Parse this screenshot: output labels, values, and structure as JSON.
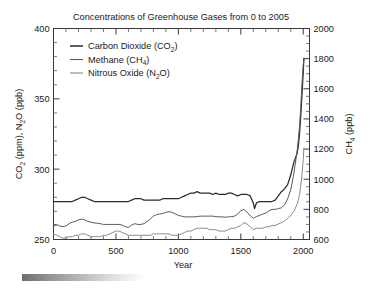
{
  "figure": {
    "title": "Concentrations of Greenhouse Gases from 0 to 2005",
    "background": "#ffffff"
  },
  "legend": {
    "position": "top-left-inside",
    "items": [
      {
        "label_main": "Carbon Dioxide (CO",
        "label_sub": "2",
        "label_end": ")",
        "color": "#2b2b2b",
        "key": "co2"
      },
      {
        "label_main": "Methane (CH",
        "label_sub": "4",
        "label_end": ")",
        "color": "#5a5a5a",
        "key": "ch4"
      },
      {
        "label_main": "Nitrous Oxide (N",
        "label_sub": "2",
        "label_end": "O)",
        "color": "#8a8a8a",
        "key": "n2o"
      }
    ]
  },
  "axes": {
    "x": {
      "label": "Year",
      "ticks": [
        "0",
        "500",
        "1000",
        "1500",
        "2000"
      ],
      "min": 0,
      "max": 2005,
      "minor_step": 100
    },
    "y_left": {
      "label_main": "CO",
      "label_sub1": "2",
      "label_mid": " (ppm), N",
      "label_sub2": "2",
      "label_end": "O (ppb)",
      "ticks": [
        "250",
        "300",
        "350",
        "400"
      ],
      "min": 250,
      "max": 400,
      "minor_step": 10
    },
    "y_right": {
      "label_main": "CH",
      "label_sub": "4",
      "label_end": " (ppb)",
      "ticks": [
        "600",
        "800",
        "1000",
        "1200",
        "1400",
        "1600",
        "1800",
        "2000"
      ],
      "min": 600,
      "max": 2000,
      "minor_step": 50
    }
  },
  "artifact": {
    "name": "gray-gradient-bar",
    "from": "#6e6e6e",
    "to": "#ffffff"
  },
  "chart_data": {
    "type": "line",
    "title": "Concentrations of Greenhouse Gases from 0 to 2005",
    "xlabel": "Year",
    "ylabel": "CO2 (ppm), N2O (ppb)",
    "ylabel_right": "CH4 (ppb)",
    "xlim": [
      0,
      2005
    ],
    "ylim_left": [
      250,
      400
    ],
    "ylim_right": [
      600,
      2000
    ],
    "grid": false,
    "legend_position": "upper left",
    "series": [
      {
        "name": "Carbon Dioxide (CO2)",
        "units": "ppm",
        "axis": "left",
        "color": "#2b2b2b",
        "x": [
          0,
          25,
          50,
          75,
          100,
          125,
          150,
          175,
          200,
          225,
          250,
          275,
          300,
          325,
          350,
          375,
          400,
          425,
          450,
          475,
          500,
          525,
          550,
          575,
          600,
          625,
          650,
          675,
          700,
          725,
          750,
          775,
          800,
          825,
          850,
          875,
          900,
          925,
          950,
          975,
          1000,
          1025,
          1050,
          1075,
          1100,
          1125,
          1150,
          1175,
          1200,
          1225,
          1250,
          1275,
          1300,
          1325,
          1350,
          1375,
          1400,
          1425,
          1450,
          1475,
          1500,
          1525,
          1550,
          1575,
          1600,
          1610,
          1625,
          1650,
          1675,
          1700,
          1725,
          1750,
          1775,
          1800,
          1825,
          1850,
          1875,
          1900,
          1925,
          1950,
          1960,
          1970,
          1980,
          1990,
          2000,
          2005
        ],
        "y": [
          277,
          277,
          277,
          277,
          277,
          277,
          277,
          278,
          279,
          280,
          280,
          279,
          278,
          277,
          277,
          277,
          277,
          277,
          277,
          277,
          277,
          277,
          277,
          277,
          277,
          278,
          279,
          279,
          279,
          278,
          278,
          278,
          278,
          278,
          278,
          279,
          279,
          279,
          279,
          279,
          279,
          280,
          281,
          282,
          283,
          283,
          284,
          283,
          283,
          283,
          283,
          282,
          283,
          282,
          282,
          282,
          283,
          283,
          282,
          281,
          282,
          282,
          282,
          281,
          276,
          272,
          276,
          277,
          277,
          277,
          277,
          277,
          278,
          281,
          284,
          286,
          289,
          296,
          305,
          311,
          316,
          325,
          338,
          353,
          369,
          379
        ]
      },
      {
        "name": "Methane (CH4)",
        "units": "ppb",
        "axis": "right",
        "color": "#5a5a5a",
        "x": [
          0,
          25,
          50,
          75,
          100,
          125,
          150,
          175,
          200,
          225,
          250,
          275,
          300,
          325,
          350,
          375,
          400,
          425,
          450,
          475,
          500,
          525,
          550,
          575,
          600,
          625,
          650,
          675,
          700,
          725,
          750,
          775,
          800,
          825,
          850,
          875,
          900,
          925,
          950,
          975,
          1000,
          1025,
          1050,
          1075,
          1100,
          1125,
          1150,
          1175,
          1200,
          1225,
          1250,
          1275,
          1300,
          1325,
          1350,
          1375,
          1400,
          1425,
          1450,
          1475,
          1500,
          1525,
          1550,
          1575,
          1600,
          1625,
          1650,
          1675,
          1700,
          1725,
          1750,
          1775,
          1800,
          1825,
          1850,
          1875,
          1900,
          1925,
          1950,
          1960,
          1970,
          1980,
          1990,
          2000,
          2005
        ],
        "y": [
          700,
          700,
          690,
          685,
          690,
          705,
          715,
          720,
          730,
          735,
          730,
          720,
          715,
          710,
          708,
          705,
          700,
          700,
          700,
          700,
          700,
          700,
          695,
          685,
          680,
          695,
          705,
          700,
          700,
          705,
          720,
          735,
          755,
          765,
          770,
          772,
          780,
          785,
          780,
          770,
          760,
          755,
          750,
          750,
          750,
          750,
          752,
          755,
          755,
          755,
          755,
          755,
          752,
          750,
          750,
          748,
          750,
          752,
          755,
          770,
          790,
          800,
          780,
          760,
          740,
          752,
          760,
          768,
          775,
          790,
          800,
          800,
          805,
          810,
          830,
          870,
          930,
          1040,
          1180,
          1260,
          1350,
          1480,
          1640,
          1760,
          1790
        ]
      },
      {
        "name": "Nitrous Oxide (N2O)",
        "units": "ppb",
        "axis": "left",
        "color": "#8a8a8a",
        "x": [
          0,
          25,
          50,
          75,
          100,
          125,
          150,
          175,
          200,
          225,
          250,
          275,
          300,
          325,
          350,
          375,
          400,
          425,
          450,
          475,
          500,
          525,
          550,
          575,
          600,
          625,
          650,
          675,
          700,
          725,
          750,
          775,
          800,
          825,
          850,
          875,
          900,
          925,
          950,
          975,
          1000,
          1025,
          1050,
          1075,
          1100,
          1125,
          1150,
          1175,
          1200,
          1225,
          1250,
          1275,
          1300,
          1325,
          1350,
          1375,
          1400,
          1425,
          1450,
          1475,
          1500,
          1525,
          1550,
          1575,
          1600,
          1625,
          1650,
          1675,
          1700,
          1725,
          1750,
          1775,
          1800,
          1825,
          1850,
          1875,
          1900,
          1925,
          1950,
          1960,
          1970,
          1980,
          1990,
          2000,
          2005
        ],
        "y": [
          254,
          253,
          252,
          251,
          251,
          252,
          252,
          253,
          253,
          254,
          254,
          253,
          252,
          252,
          252,
          252,
          253,
          253,
          254,
          255,
          256,
          256,
          255,
          254,
          253,
          253,
          253,
          253,
          253,
          253,
          253,
          253,
          254,
          254,
          254,
          254,
          254,
          254,
          253,
          253,
          253,
          254,
          255,
          256,
          256,
          257,
          258,
          258,
          258,
          258,
          257,
          257,
          257,
          256,
          256,
          256,
          257,
          258,
          258,
          259,
          260,
          262,
          261,
          259,
          257,
          258,
          258,
          258,
          259,
          259,
          260,
          260,
          261,
          262,
          263,
          265,
          267,
          270,
          275,
          278,
          282,
          288,
          296,
          307,
          315
        ]
      }
    ]
  }
}
